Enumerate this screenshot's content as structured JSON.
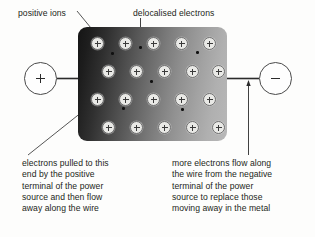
{
  "figure": {
    "type": "diagram",
    "annotations": {
      "positive_ions": "positive ions",
      "delocalised_electrons": "delocalised electrons"
    },
    "captions": {
      "left": [
        "electrons pulled to this",
        "end by the positive",
        "terminal of the power",
        "source and then flow",
        "away along the wire"
      ],
      "right": [
        "more electrons flow along",
        "the wire from the negative",
        "terminal of the power",
        "source to replace those",
        "moving away in the metal"
      ]
    },
    "terminals": {
      "positive": "+",
      "negative": "–"
    },
    "lattice": {
      "rows": 4,
      "columns": 5,
      "ion_charge": "+"
    },
    "colors": {
      "text": "#231f20",
      "block_dark": "#151515",
      "block_light": "#b8b8b8",
      "ion_fill": "#e9e9e6",
      "line": "#2b2b2b"
    }
  }
}
